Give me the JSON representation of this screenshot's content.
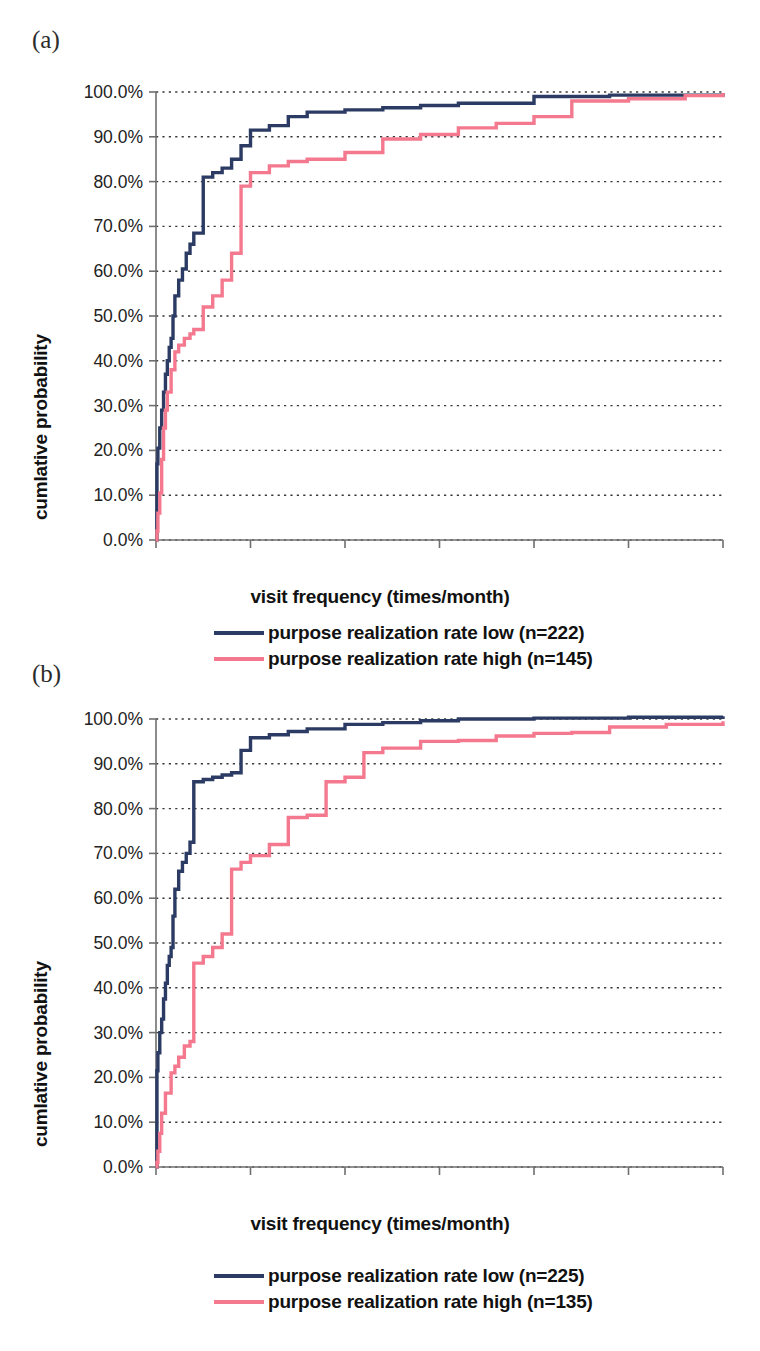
{
  "figure": {
    "panels": [
      {
        "key": "a",
        "label": "(a)",
        "legend": [
          {
            "name": "purpose realization rate low (n=222)",
            "color": "#2b3b63"
          },
          {
            "name": "purpose realization rate high (n=145)",
            "color": "#f4798f"
          }
        ]
      },
      {
        "key": "b",
        "label": "(b)",
        "legend": [
          {
            "name": "purpose realization rate low (n=225)",
            "color": "#2b3b63"
          },
          {
            "name": "purpose realization rate high (n=135)",
            "color": "#f4798f"
          }
        ]
      }
    ]
  },
  "chart_data": [
    {
      "id": "panel-a",
      "type": "line",
      "title": "",
      "panel_label": "(a)",
      "xlabel": "visit frequency (times/month)",
      "ylabel": "cumlative probability",
      "xlim": [
        0,
        30
      ],
      "ylim": [
        0,
        1.0
      ],
      "xticks": [
        0,
        5,
        10,
        15,
        20,
        25,
        30
      ],
      "xticklabels": [
        "0",
        "5",
        "10",
        "15",
        "20",
        "25",
        "30"
      ],
      "yticks": [
        0.0,
        0.1,
        0.2,
        0.3,
        0.4,
        0.5,
        0.6,
        0.7,
        0.8,
        0.9,
        1.0
      ],
      "yticklabels": [
        "0.0%",
        "10.0%",
        "20.0%",
        "30.0%",
        "40.0%",
        "50.0%",
        "60.0%",
        "70.0%",
        "80.0%",
        "90.0%",
        "100.0%"
      ],
      "grid": "horizontal-dotted",
      "legend_position": "below",
      "step_style": "post",
      "series": [
        {
          "name": "purpose realization rate low (n=222)",
          "color": "#2b3b63",
          "x": [
            0.0,
            0.05,
            0.1,
            0.2,
            0.3,
            0.4,
            0.5,
            0.6,
            0.7,
            0.8,
            0.9,
            1.0,
            1.2,
            1.4,
            1.6,
            1.8,
            2.0,
            2.5,
            3.0,
            3.5,
            4.0,
            4.5,
            5.0,
            6.0,
            7.0,
            8.0,
            10.0,
            12.0,
            14.0,
            16.0,
            20.0,
            24.0,
            30.0
          ],
          "y": [
            0.0,
            0.17,
            0.205,
            0.25,
            0.29,
            0.33,
            0.37,
            0.4,
            0.43,
            0.45,
            0.5,
            0.545,
            0.58,
            0.605,
            0.64,
            0.66,
            0.685,
            0.81,
            0.82,
            0.83,
            0.85,
            0.88,
            0.915,
            0.925,
            0.945,
            0.955,
            0.96,
            0.965,
            0.97,
            0.975,
            0.99,
            0.993,
            0.998
          ]
        },
        {
          "name": "purpose realization rate high (n=145)",
          "color": "#f4798f",
          "x": [
            0.0,
            0.05,
            0.1,
            0.2,
            0.3,
            0.4,
            0.5,
            0.6,
            0.8,
            1.0,
            1.2,
            1.5,
            1.8,
            2.0,
            2.5,
            3.0,
            3.5,
            4.0,
            4.5,
            5.0,
            6.0,
            7.0,
            8.0,
            10.0,
            12.0,
            14.0,
            16.0,
            18.0,
            20.0,
            22.0,
            25.0,
            28.0,
            30.0
          ],
          "y": [
            0.0,
            0.02,
            0.06,
            0.105,
            0.18,
            0.25,
            0.29,
            0.33,
            0.38,
            0.42,
            0.435,
            0.45,
            0.46,
            0.47,
            0.52,
            0.545,
            0.58,
            0.64,
            0.79,
            0.82,
            0.835,
            0.845,
            0.85,
            0.865,
            0.895,
            0.905,
            0.92,
            0.93,
            0.945,
            0.98,
            0.985,
            0.992,
            0.998
          ]
        }
      ]
    },
    {
      "id": "panel-b",
      "type": "line",
      "title": "",
      "panel_label": "(b)",
      "xlabel": "visit frequency (times/month)",
      "ylabel": "cumlative probability",
      "xlim": [
        0,
        30
      ],
      "ylim": [
        0,
        1.0
      ],
      "xticks": [
        0,
        5,
        10,
        15,
        20,
        25,
        30
      ],
      "xticklabels": [
        "0",
        "5",
        "10",
        "15",
        "20",
        "25",
        "30"
      ],
      "yticks": [
        0.0,
        0.1,
        0.2,
        0.3,
        0.4,
        0.5,
        0.6,
        0.7,
        0.8,
        0.9,
        1.0
      ],
      "yticklabels": [
        "0.0%",
        "10.0%",
        "20.0%",
        "30.0%",
        "40.0%",
        "50.0%",
        "60.0%",
        "70.0%",
        "80.0%",
        "90.0%",
        "100.0%"
      ],
      "grid": "horizontal-dotted",
      "legend_position": "below",
      "step_style": "post",
      "series": [
        {
          "name": "purpose realization rate low (n=225)",
          "color": "#2b3b63",
          "x": [
            0.0,
            0.05,
            0.1,
            0.2,
            0.3,
            0.4,
            0.5,
            0.6,
            0.7,
            0.8,
            0.9,
            1.0,
            1.2,
            1.4,
            1.6,
            1.8,
            2.0,
            2.5,
            3.0,
            3.5,
            4.0,
            4.5,
            5.0,
            6.0,
            7.0,
            8.0,
            10.0,
            12.0,
            14.0,
            16.0,
            20.0,
            25.0,
            30.0
          ],
          "y": [
            0.0,
            0.215,
            0.255,
            0.3,
            0.33,
            0.375,
            0.41,
            0.45,
            0.47,
            0.49,
            0.56,
            0.62,
            0.66,
            0.68,
            0.7,
            0.725,
            0.86,
            0.865,
            0.87,
            0.875,
            0.88,
            0.93,
            0.958,
            0.965,
            0.972,
            0.978,
            0.988,
            0.992,
            0.996,
            1.0,
            1.002,
            1.004,
            1.006
          ]
        },
        {
          "name": "purpose realization rate high (n=135)",
          "color": "#f4798f",
          "x": [
            0.0,
            0.05,
            0.1,
            0.2,
            0.3,
            0.5,
            0.8,
            1.0,
            1.2,
            1.5,
            1.8,
            2.0,
            2.5,
            3.0,
            3.5,
            4.0,
            4.5,
            5.0,
            6.0,
            7.0,
            8.0,
            9.0,
            10.0,
            11.0,
            12.0,
            14.0,
            16.0,
            18.0,
            20.0,
            22.0,
            24.0,
            27.0,
            30.0
          ],
          "y": [
            0.0,
            0.01,
            0.035,
            0.075,
            0.12,
            0.165,
            0.21,
            0.225,
            0.245,
            0.27,
            0.28,
            0.455,
            0.47,
            0.49,
            0.52,
            0.665,
            0.68,
            0.695,
            0.72,
            0.78,
            0.785,
            0.86,
            0.87,
            0.925,
            0.935,
            0.95,
            0.952,
            0.962,
            0.968,
            0.97,
            0.982,
            0.988,
            0.995
          ]
        }
      ]
    }
  ]
}
